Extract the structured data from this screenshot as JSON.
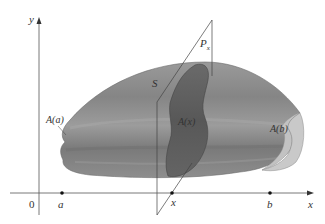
{
  "figure": {
    "type": "solid-cross-section-diagram",
    "axes": {
      "x_label": "x",
      "y_label": "y",
      "origin_label": "0"
    },
    "points_on_x_axis": [
      {
        "label": "a"
      },
      {
        "label": "x"
      },
      {
        "label": "b"
      }
    ],
    "labels": {
      "solid": "S",
      "plane": "P",
      "plane_subscript": "x",
      "cross_section_left": "A(a)",
      "cross_section_middle": "A(x)",
      "cross_section_right": "A(b)"
    },
    "colors": {
      "solid_fill": "#8a8a8a",
      "solid_highlight": "#b0b0b0",
      "cross_section_fill": "#5e5e5e",
      "end_face_fill": "#c4c4c4",
      "axis_color": "#555555"
    }
  }
}
